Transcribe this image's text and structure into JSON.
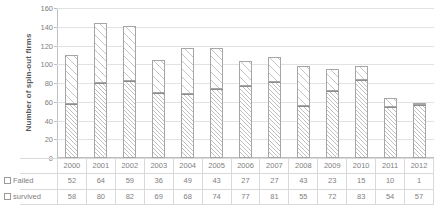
{
  "chart_data": {
    "type": "bar",
    "subtype": "stacked-column",
    "title": "",
    "xlabel": "",
    "ylabel": "Number of spin-out firms",
    "ylim": [
      0,
      160
    ],
    "ytick_step": 20,
    "yticks": [
      0,
      20,
      40,
      60,
      80,
      100,
      120,
      140,
      160
    ],
    "grid": "horizontal",
    "legend_position": "data-table-row-labels",
    "categories": [
      "2000",
      "2001",
      "2002",
      "2003",
      "2004",
      "2005",
      "2006",
      "2007",
      "2008",
      "2009",
      "2010",
      "2011",
      "2012"
    ],
    "series": [
      {
        "name": "Failed",
        "marker": "open-square",
        "stack_position": "top",
        "values": [
          52,
          64,
          59,
          36,
          49,
          43,
          27,
          27,
          43,
          23,
          15,
          10,
          1
        ]
      },
      {
        "name": "survived",
        "marker": "open-square",
        "stack_position": "bottom",
        "values": [
          58,
          80,
          82,
          69,
          68,
          74,
          77,
          81,
          55,
          72,
          83,
          54,
          57
        ]
      }
    ],
    "totals": [
      110,
      144,
      141,
      105,
      117,
      117,
      104,
      108,
      98,
      95,
      98,
      64,
      58
    ],
    "colors": {
      "bar_fill": "#ffffff",
      "bar_border": "#a6a6a6",
      "hatch": "#969696",
      "gridline": "#e2e2e2",
      "axis": "#bfbfbf",
      "text": "#808080",
      "axis_title": "#595959"
    }
  },
  "table": {
    "row_labels": [
      "Failed",
      "survived"
    ],
    "year_row": [
      "2000",
      "2001",
      "2002",
      "2003",
      "2004",
      "2005",
      "2006",
      "2007",
      "2008",
      "2009",
      "2010",
      "2011",
      "2012"
    ],
    "failed_row": [
      "52",
      "64",
      "59",
      "36",
      "49",
      "43",
      "27",
      "27",
      "43",
      "23",
      "15",
      "10",
      "1"
    ],
    "survived_row": [
      "58",
      "80",
      "82",
      "69",
      "68",
      "74",
      "77",
      "81",
      "55",
      "72",
      "83",
      "54",
      "57"
    ]
  },
  "axis": {
    "y_title": "Number of spin-out firms",
    "y_labels": [
      "160",
      "140",
      "120",
      "100",
      "80",
      "60",
      "40",
      "20",
      "0"
    ]
  }
}
